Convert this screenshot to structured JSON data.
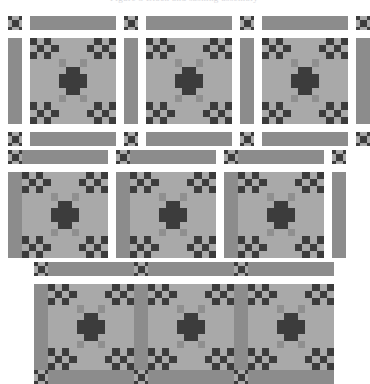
{
  "header": {
    "text": "Figure 3  Block and sashing assembly"
  },
  "palette": {
    "background": "#ffffff",
    "light": "#a9a9a9",
    "medium": "#8f8f8f",
    "sashing": "#8c8c8c",
    "dark": "#3c3c3c",
    "darkest": "#303030",
    "outline": "#6f6f6f"
  },
  "diagram": {
    "units": "blocks",
    "block_grid": 12,
    "blocks_per_row": 3,
    "stage_count": 3,
    "stages": [
      {
        "id": "stage-exploded",
        "label": "Exploded layout: blocks, sashing strips and cornerstones separated",
        "rows": 1,
        "blocks": 3,
        "horizontal_sashing": 3,
        "vertical_sashing": 4,
        "cornerstones": 4
      },
      {
        "id": "stage-rows-joined",
        "label": "Sashing rows joined to block rows",
        "rows": 1,
        "blocks": 3,
        "horizontal_sashing": 3,
        "vertical_sashing": 1,
        "cornerstones": 3
      },
      {
        "id": "stage-assembled",
        "label": "Completed assembled row with sashing sewn in place",
        "rows": 1,
        "blocks": 3,
        "horizontal_sashing": 3,
        "vertical_sashing": 0,
        "cornerstones": 3
      }
    ]
  },
  "block_pattern": {
    "name": "burgoyne-surrounded-block",
    "size": 12,
    "legend": {
      "L": "light",
      "M": "medium",
      "D": "dark"
    },
    "rows": [
      "DLDLLLLLLDLD",
      "LDLDLLLLDLDL",
      "DLDLLLLLLDLD",
      "LLLLMLLMLLLL",
      "LLLLLDDLLLLL",
      "LLLLDDDDLLLL",
      "LLLLDDDDLLLL",
      "LLLLLDDLLLLL",
      "LLLLMLLMLLLL",
      "DLDLLLLLLDLD",
      "LDLDLLLLDLDL",
      "DLDLLLLLLDLD"
    ]
  },
  "cornerstone_pattern": {
    "name": "nine-patch-cornerstone",
    "size": 4,
    "rows": [
      "DLLD",
      "LDDL",
      "LDDL",
      "DLLD"
    ]
  }
}
